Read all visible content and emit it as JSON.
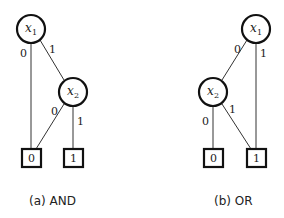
{
  "diagrams": [
    {
      "id": "and",
      "caption": "(a) AND",
      "nodes": {
        "x1": {
          "var": "x",
          "sub": "1"
        },
        "x2": {
          "var": "x",
          "sub": "2"
        },
        "t0": {
          "label": "0"
        },
        "t1": {
          "label": "1"
        }
      },
      "edges": {
        "x1_t0": "0",
        "x1_x2": "1",
        "x2_t0": "0",
        "x2_t1": "1"
      }
    },
    {
      "id": "or",
      "caption": "(b) OR",
      "nodes": {
        "x1": {
          "var": "x",
          "sub": "1"
        },
        "x2": {
          "var": "x",
          "sub": "2"
        },
        "t0": {
          "label": "0"
        },
        "t1": {
          "label": "1"
        }
      },
      "edges": {
        "x1_x2": "0",
        "x1_t1": "1",
        "x2_t0": "0",
        "x2_t1": "1"
      }
    }
  ]
}
